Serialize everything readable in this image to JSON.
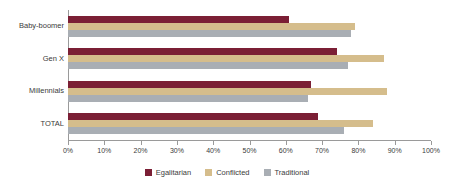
{
  "chart_data": {
    "type": "bar",
    "orientation": "horizontal",
    "title": "",
    "subtitle": "",
    "xlabel": "",
    "ylabel": "",
    "categories": [
      "Baby-boomer",
      "Gen X",
      "Millennials",
      "TOTAL"
    ],
    "series": [
      {
        "name": "Egalitarian",
        "color": "#7b1f35",
        "values": [
          61,
          74,
          67,
          69
        ]
      },
      {
        "name": "Conflicted",
        "color": "#d5bd8c",
        "values": [
          79,
          87,
          88,
          84
        ]
      },
      {
        "name": "Traditional",
        "color": "#a9aeb4",
        "values": [
          78,
          77,
          66,
          76
        ]
      }
    ],
    "xlim": [
      0,
      100
    ],
    "xticks": [
      0,
      10,
      20,
      30,
      40,
      50,
      60,
      70,
      80,
      90,
      100
    ],
    "xtick_labels": [
      "0%",
      "10%",
      "20%",
      "30%",
      "40%",
      "50%",
      "60%",
      "70%",
      "80%",
      "90%",
      "100%"
    ],
    "grid": false,
    "legend_position": "bottom"
  },
  "legend": {
    "items": [
      {
        "label": "Egalitarian"
      },
      {
        "label": "Conflicted"
      },
      {
        "label": "Traditional"
      }
    ]
  },
  "axis": {
    "y_categories": [
      {
        "label": "Baby-boomer"
      },
      {
        "label": "Gen X"
      },
      {
        "label": "Millennials"
      },
      {
        "label": "TOTAL"
      }
    ],
    "x_ticks": [
      {
        "label": "0%"
      },
      {
        "label": "10%"
      },
      {
        "label": "20%"
      },
      {
        "label": "30%"
      },
      {
        "label": "40%"
      },
      {
        "label": "50%"
      },
      {
        "label": "60%"
      },
      {
        "label": "70%"
      },
      {
        "label": "80%"
      },
      {
        "label": "90%"
      },
      {
        "label": "100%"
      }
    ]
  }
}
